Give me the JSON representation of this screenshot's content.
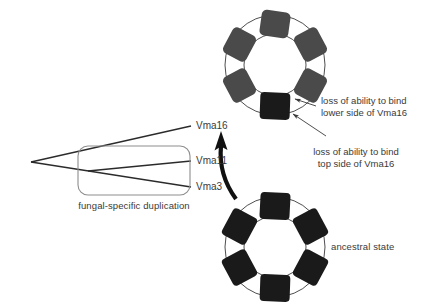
{
  "diagram": {
    "title_text": "",
    "tree": {
      "taxa": [
        {
          "id": "vma16",
          "label": "Vma16",
          "x": 196,
          "y": 127
        },
        {
          "id": "vma11",
          "label": "Vma11",
          "x": 196,
          "y": 162
        },
        {
          "id": "vma3",
          "label": "Vma3",
          "x": 196,
          "y": 188
        }
      ],
      "duplication_box_caption": "fungal-specific duplication",
      "caption_x": 134,
      "caption_y": 205
    },
    "rings": [
      {
        "id": "derived-ring",
        "state_label": "",
        "center_x": 275,
        "center_y": 65,
        "subunits": [
          {
            "index": 0,
            "angle": -90,
            "color": "#4a4a4a"
          },
          {
            "index": 1,
            "angle": -30,
            "color": "#4a4a4a"
          },
          {
            "index": 2,
            "angle": 30,
            "color": "#4a4a4a"
          },
          {
            "index": 3,
            "angle": 90,
            "color": "#1a1a1a"
          },
          {
            "index": 4,
            "angle": 150,
            "color": "#4a4a4a"
          },
          {
            "index": 5,
            "angle": 210,
            "color": "#4a4a4a"
          }
        ]
      },
      {
        "id": "ancestral-ring",
        "state_label": "ancestral state",
        "state_label_x": 331,
        "state_label_y": 242,
        "center_x": 275,
        "center_y": 247,
        "subunits": [
          {
            "index": 0,
            "angle": -90,
            "color": "#1a1a1a"
          },
          {
            "index": 1,
            "angle": -30,
            "color": "#1a1a1a"
          },
          {
            "index": 2,
            "angle": 30,
            "color": "#1a1a1a"
          },
          {
            "index": 3,
            "angle": 90,
            "color": "#1a1a1a"
          },
          {
            "index": 4,
            "angle": 150,
            "color": "#1a1a1a"
          },
          {
            "index": 5,
            "angle": 210,
            "color": "#1a1a1a"
          }
        ]
      }
    ],
    "annotations": [
      {
        "id": "lower-side-callout",
        "line1": "loss of ability to bind",
        "line2": "lower side of Vma16",
        "x": 321,
        "y": 99
      },
      {
        "id": "top-side-callout",
        "line1": "loss of ability to bind",
        "line2": "top side of Vma16",
        "x": 356,
        "y": 150
      }
    ],
    "colors": {
      "subunit_gray": "#4a4a4a",
      "subunit_black": "#1a1a1a",
      "ring_outline": "#3a3a3a",
      "text": "#3a3a3a",
      "box_outline": "#8d8d8d",
      "tree_line": "#2b2b2b",
      "arrow": "#111111"
    }
  }
}
